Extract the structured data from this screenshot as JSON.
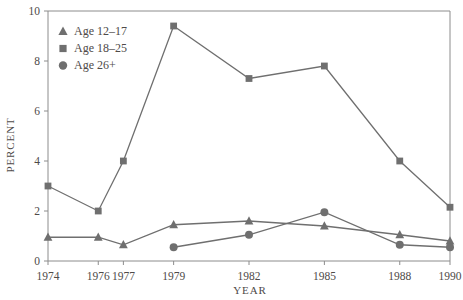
{
  "chart_data": {
    "type": "line",
    "title": "",
    "subtitle": "",
    "xlabel": "YEAR",
    "ylabel": "PERCENT",
    "categories": [
      "1974",
      "1976",
      "1977",
      "1979",
      "1982",
      "1985",
      "1988",
      "1990"
    ],
    "x": [
      1974,
      1976,
      1977,
      1979,
      1982,
      1985,
      1988,
      1990
    ],
    "xlim": [
      1974,
      1990
    ],
    "ylim": [
      0,
      10
    ],
    "yticks": [
      "0",
      "2",
      "4",
      "6",
      "8",
      "10"
    ],
    "ytick_values": [
      0,
      2,
      4,
      6,
      8,
      10
    ],
    "xticks": [
      "1974",
      "1976",
      "1977",
      "1979",
      "1982",
      "1985",
      "1988",
      "1990"
    ],
    "grid": false,
    "legend_position": "top-left",
    "series": [
      {
        "name": "Age 12–17",
        "marker": "triangle",
        "color": "#6f6f6f",
        "x": [
          1974,
          1976,
          1977,
          1979,
          1982,
          1985,
          1988,
          1990
        ],
        "values": [
          0.95,
          0.95,
          0.65,
          1.45,
          1.6,
          1.4,
          1.05,
          0.8
        ]
      },
      {
        "name": "Age 18–25",
        "marker": "square",
        "color": "#6f6f6f",
        "x": [
          1974,
          1976,
          1977,
          1979,
          1982,
          1985,
          1988,
          1990
        ],
        "values": [
          3.0,
          2.0,
          4.0,
          9.4,
          7.3,
          7.8,
          4.0,
          2.15
        ]
      },
      {
        "name": "Age 26+",
        "marker": "circle",
        "color": "#6f6f6f",
        "x": [
          1979,
          1982,
          1985,
          1988,
          1990
        ],
        "values": [
          0.55,
          1.05,
          1.95,
          0.65,
          0.55
        ]
      }
    ]
  },
  "legend": {
    "items": [
      {
        "label": "Age 12–17",
        "marker": "triangle"
      },
      {
        "label": "Age 18–25",
        "marker": "square"
      },
      {
        "label": "Age 26+",
        "marker": "circle"
      }
    ]
  },
  "colors": {
    "series": "#6f6f6f",
    "axis": "#8c8c8c",
    "text": "#4e4a48",
    "background": "#ffffff"
  }
}
